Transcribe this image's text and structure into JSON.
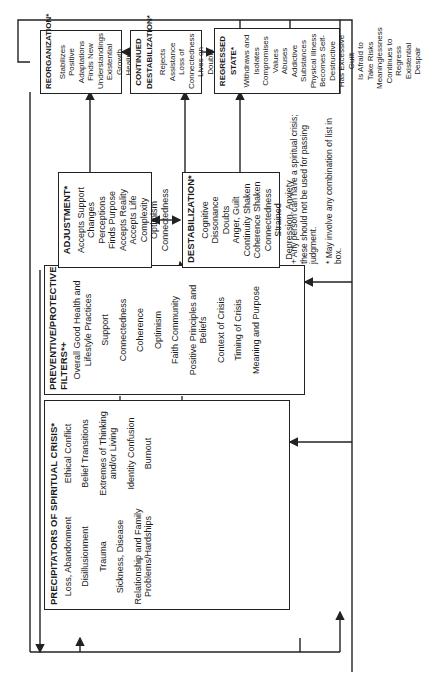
{
  "diagram": {
    "precipitators": {
      "title": "PRECIPITATORS OF SPIRITUAL CRISIS*",
      "items": [
        "Loss, Abandonment",
        "Disillusionment",
        "Trauma",
        "Sickness, Disease",
        "Relationship and Family Problems/Hardships",
        "Ethical Conflict",
        "Belief Transitions",
        "Extremes of Thinking and/or Living",
        "Identity Confusion",
        "Burnout"
      ]
    },
    "filters": {
      "title": "PREVENTIVE/PROTECTIVE FILTERS*+",
      "items_top": [
        "Overall Good Health and Lifestyle Practices",
        "Support",
        "Connectedness",
        "Coherence"
      ],
      "items_bottom": [
        "Optimism",
        "Faith Community",
        "Positive Principles and Beliefs",
        "Context of Crisis",
        "Timing of Crisis",
        "Meaning and Purpose"
      ]
    },
    "adjustment": {
      "title": "ADJUSTMENT*",
      "items": [
        "Accepts Support",
        "Changes Perceptions",
        "Finds Purpose",
        "Accepts Reality",
        "Accepts Life Complexity",
        "Optimism",
        "Connectedness"
      ]
    },
    "destabilization": {
      "title": "DESTABILIZATION*",
      "items": [
        "Cognitive Dissonance",
        "Doubts",
        "Anger, Guilt",
        "Continuity Shaken",
        "Coherence Shaken",
        "Connectedness Strained",
        "Depression, Anxiety"
      ]
    },
    "reorganization": {
      "title": "REORGANIZATION*",
      "items": [
        "Stabilizes",
        "Positive Adaptations",
        "Finds New Understandings",
        "Existential Growth",
        "Healing",
        "Creativity"
      ]
    },
    "continued_destabilization": {
      "title": "CONTINUED DESTABILIZATION*",
      "items": [
        "Rejects Assistance",
        "Loss of Connectedness",
        "Lives on Doubts",
        "Becomes Negative and Cynical",
        "Experiences Rage, Hostility"
      ]
    },
    "regressed_state": {
      "title": "REGRESSED STATE*",
      "items": [
        "Withdraws and Isolates",
        "Compromises Values",
        "Abuses Addictive Substances",
        "Physical Illness",
        "Becomes Self-Destructive",
        "Has Excessive Guilt",
        "Is Afraid to Take Risks",
        "Meaninglessness",
        "Continues to Regress",
        "Existential Despair"
      ]
    },
    "footnotes": [
      "+ Any person can have a spiritual crisis; these should not be used for passing judgment.",
      "* May involve any combination of list in box."
    ],
    "colors": {
      "line": "#222222",
      "background": "#ffffff",
      "text": "#1a1a1a"
    }
  }
}
